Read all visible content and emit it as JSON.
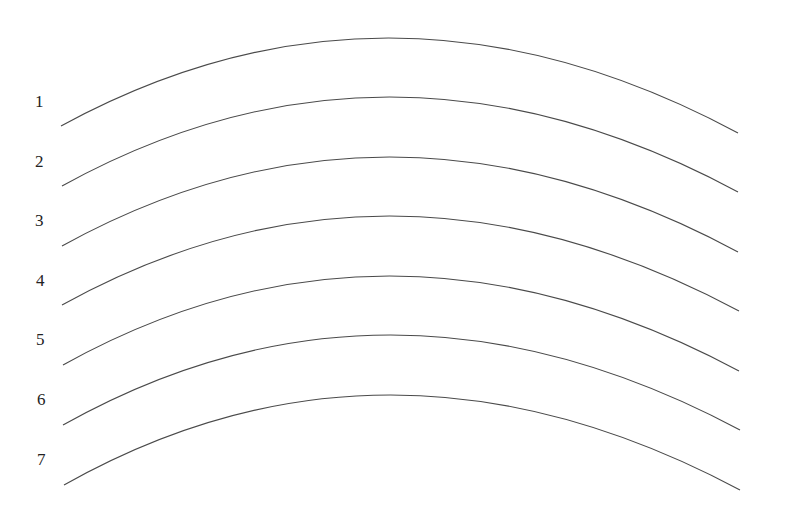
{
  "diagram": {
    "type": "stacked-arcs",
    "stroke_color": "#4a4a4a",
    "label_color": "#222222",
    "background": "#ffffff",
    "arcs": [
      {
        "label": "1",
        "label_x": 35,
        "label_y": 107,
        "x0": 61,
        "y0": 126,
        "cx": 395,
        "peak_y": 38,
        "x1": 738,
        "y1": 133
      },
      {
        "label": "2",
        "label_x": 35,
        "label_y": 167,
        "x0": 62,
        "y0": 186,
        "cx": 395,
        "peak_y": 97,
        "x1": 738,
        "y1": 192
      },
      {
        "label": "3",
        "label_x": 35,
        "label_y": 226,
        "x0": 62,
        "y0": 246,
        "cx": 395,
        "peak_y": 157,
        "x1": 738,
        "y1": 252
      },
      {
        "label": "4",
        "label_x": 36,
        "label_y": 286,
        "x0": 62,
        "y0": 305,
        "cx": 395,
        "peak_y": 216,
        "x1": 739,
        "y1": 311
      },
      {
        "label": "5",
        "label_x": 36,
        "label_y": 345,
        "x0": 63,
        "y0": 365,
        "cx": 395,
        "peak_y": 276,
        "x1": 739,
        "y1": 371
      },
      {
        "label": "6",
        "label_x": 37,
        "label_y": 405,
        "x0": 63,
        "y0": 425,
        "cx": 395,
        "peak_y": 335,
        "x1": 740,
        "y1": 430
      },
      {
        "label": "7",
        "label_x": 37,
        "label_y": 465,
        "x0": 64,
        "y0": 485,
        "cx": 395,
        "peak_y": 395,
        "x1": 740,
        "y1": 490
      }
    ]
  }
}
